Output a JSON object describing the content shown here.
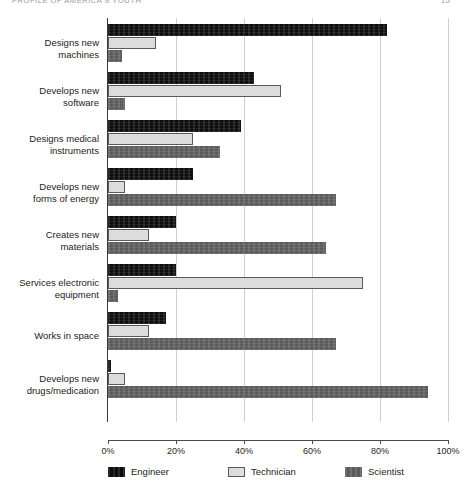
{
  "header": {
    "running_head": "PROFILE OF AMERICA'S YOUTH",
    "page_number": "15"
  },
  "chart_data": {
    "type": "bar",
    "orientation": "horizontal",
    "title": "",
    "xlabel": "",
    "ylabel": "",
    "xlim": [
      0,
      100
    ],
    "xticks": [
      "0%",
      "20%",
      "40%",
      "60%",
      "80%",
      "100%"
    ],
    "xtick_values": [
      0,
      20,
      40,
      60,
      80,
      100
    ],
    "grid": "vertical-light",
    "legend_position": "bottom",
    "categories": [
      "Designs new\nmachines",
      "Develops new\nsoftware",
      "Designs medical\ninstruments",
      "Develops new\nforms of energy",
      "Creates new\nmaterials",
      "Services electronic\nequipment",
      "Works in space",
      "Develops new\ndrugs/medication"
    ],
    "series": [
      {
        "name": "Engineer",
        "color": "#0d0d0d",
        "values": [
          82,
          43,
          39,
          25,
          20,
          20,
          17,
          1
        ]
      },
      {
        "name": "Technician",
        "color": "#dcdcdc",
        "values": [
          14,
          51,
          25,
          5,
          12,
          75,
          12,
          5
        ]
      },
      {
        "name": "Scientist",
        "color": "#5c5c5c",
        "values": [
          4,
          5,
          33,
          67,
          64,
          3,
          67,
          94
        ]
      }
    ]
  }
}
